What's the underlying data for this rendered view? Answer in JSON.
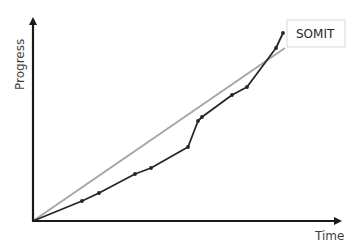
{
  "chart_data": {
    "type": "line",
    "title": "",
    "xlabel": "Time",
    "ylabel": "Progress",
    "grid": false,
    "axes": {
      "origin_px": [
        33,
        221
      ],
      "x_end_px": [
        344,
        221
      ],
      "y_end_px": [
        33,
        15
      ]
    },
    "series": [
      {
        "name": "Ideal linear progress",
        "color": "#a6a6a6",
        "markers": false,
        "points_px": [
          [
            33,
            221
          ],
          [
            285,
            48
          ]
        ]
      },
      {
        "name": "Actual progress",
        "color": "#262626",
        "markers": true,
        "points_px": [
          [
            33,
            221
          ],
          [
            82,
            201
          ],
          [
            99,
            193
          ],
          [
            135,
            174
          ],
          [
            151,
            168
          ],
          [
            188,
            147
          ],
          [
            198,
            121
          ],
          [
            202,
            117
          ],
          [
            232,
            95
          ],
          [
            247,
            87
          ],
          [
            276,
            48
          ],
          [
            283,
            33
          ]
        ]
      }
    ],
    "annotations": [
      {
        "text": "SOMIT",
        "box_px": [
          287,
          20,
          58,
          27
        ]
      }
    ]
  },
  "labels": {
    "x_axis": "Time",
    "y_axis": "Progress",
    "callout": "SOMIT"
  },
  "colors": {
    "axis": "#1a1a1a",
    "ideal_line": "#a6a6a6",
    "actual_line": "#262626",
    "callout_border": "#d9d9d9"
  }
}
